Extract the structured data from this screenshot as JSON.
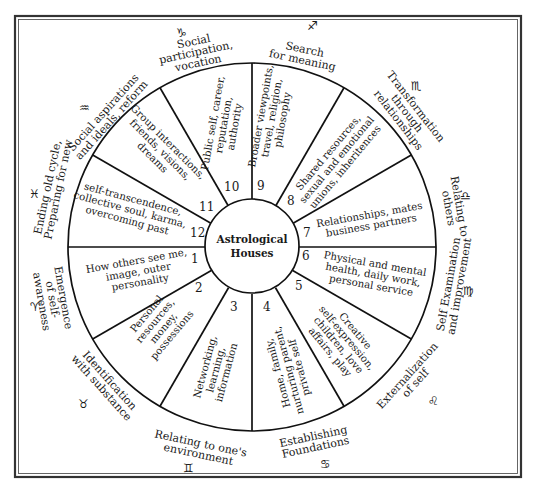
{
  "diagram": {
    "title_line1": "Astrological",
    "title_line2": "Houses",
    "colors": {
      "ink": "#111111",
      "background": "#ffffff",
      "frame": "#333333"
    },
    "houses": [
      {
        "number": "1",
        "lines": [
          "How others see me,",
          "image, outer",
          "personality"
        ]
      },
      {
        "number": "2",
        "lines": [
          "Personal",
          "resources,",
          "money,",
          "possessions"
        ]
      },
      {
        "number": "3",
        "lines": [
          "Networking,",
          "learning,",
          "information"
        ]
      },
      {
        "number": "4",
        "lines": [
          "Home, family,",
          "nurturing parent,",
          "private self"
        ]
      },
      {
        "number": "5",
        "lines": [
          "Creative",
          "self-expression,",
          "children, love",
          "affairs, play"
        ]
      },
      {
        "number": "6",
        "lines": [
          "Physical and mental",
          "health, daily work,",
          "personal service"
        ]
      },
      {
        "number": "7",
        "lines": [
          "Relationships, mates",
          "business partners"
        ]
      },
      {
        "number": "8",
        "lines": [
          "Shared resources,",
          "sexual and emotional",
          "unions, inheritences"
        ]
      },
      {
        "number": "9",
        "lines": [
          "Broader viewpoints,",
          "travel, religion,",
          "philosophy"
        ]
      },
      {
        "number": "10",
        "lines": [
          "Public self, career,",
          "reputation,",
          "authority"
        ]
      },
      {
        "number": "11",
        "lines": [
          "Group interactions,",
          "friends, visions,",
          "dreams"
        ]
      },
      {
        "number": "12",
        "lines": [
          "self-transcendence,",
          "collective soul, karma,",
          "overcoming past"
        ]
      }
    ],
    "signs": [
      {
        "name": "aries",
        "glyph": "♈",
        "lines": [
          "Emergence",
          "of self-",
          "awareness"
        ]
      },
      {
        "name": "taurus",
        "glyph": "♉",
        "lines": [
          "Identification",
          "with substance"
        ]
      },
      {
        "name": "gemini",
        "glyph": "♊",
        "lines": [
          "Relating to one's",
          "environment"
        ]
      },
      {
        "name": "cancer",
        "glyph": "♋",
        "lines": [
          "Establishing",
          "Foundations"
        ]
      },
      {
        "name": "leo",
        "glyph": "♌",
        "lines": [
          "Externalization",
          "of self"
        ]
      },
      {
        "name": "virgo",
        "glyph": "♍",
        "lines": [
          "Self Examination",
          "and improvement"
        ]
      },
      {
        "name": "libra",
        "glyph": "♎",
        "lines": [
          "Relating to",
          "others"
        ]
      },
      {
        "name": "scorpio",
        "glyph": "♏",
        "lines": [
          "Transformation",
          "through",
          "relationships"
        ]
      },
      {
        "name": "sagittarius",
        "glyph": "♐",
        "lines": [
          "Search",
          "for meaning"
        ]
      },
      {
        "name": "capricorn",
        "glyph": "♑",
        "lines": [
          "Social",
          "participation,",
          "vocation"
        ]
      },
      {
        "name": "aquarius",
        "glyph": "♒",
        "lines": [
          "Social aspirations",
          "and ideals, reform"
        ]
      },
      {
        "name": "pisces",
        "glyph": "♓",
        "lines": [
          "Ending old cycle,",
          "Preparing for new"
        ]
      }
    ]
  }
}
